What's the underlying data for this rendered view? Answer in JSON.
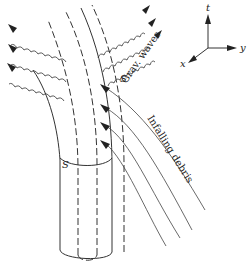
{
  "figure": {
    "labels": {
      "grav_waves": "Grav. waves",
      "infalling_debris": "Infalling debris",
      "surface_lower": "S",
      "surface_upper": "S"
    },
    "axes": {
      "t": "t",
      "x": "x",
      "y": "y"
    },
    "elements": {
      "world_tube": "solid outer cylinder with bottom ellipse and cross-section S",
      "inner_tube": "dashed inner cylinder",
      "gravitational_waves_left": 3,
      "gravitational_waves_right": 3,
      "infalling_debris_lines": 4
    },
    "colors": {
      "ink": "#333333",
      "background": "#ffffff"
    }
  }
}
